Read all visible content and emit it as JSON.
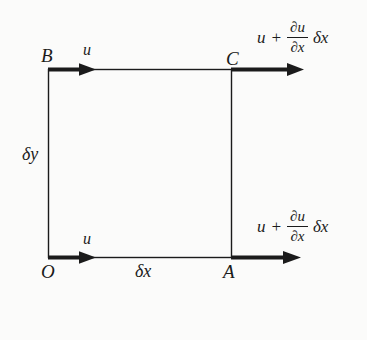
{
  "palette": {
    "background": "#fbfbfa",
    "ink": "#1b1b1b"
  },
  "diagram": {
    "corners": {
      "top_left": "B",
      "top_right": "C",
      "bottom_left": "O",
      "bottom_right": "A"
    },
    "edge_labels": {
      "left_height": "δy",
      "bottom_width": "δx"
    },
    "velocity_labels": {
      "top_inflow": "u",
      "bottom_inflow": "u"
    },
    "flux_formula": {
      "lhs": "u",
      "operator": "+",
      "numerator": "∂u",
      "denominator": "∂x",
      "rhs": "δx"
    }
  }
}
